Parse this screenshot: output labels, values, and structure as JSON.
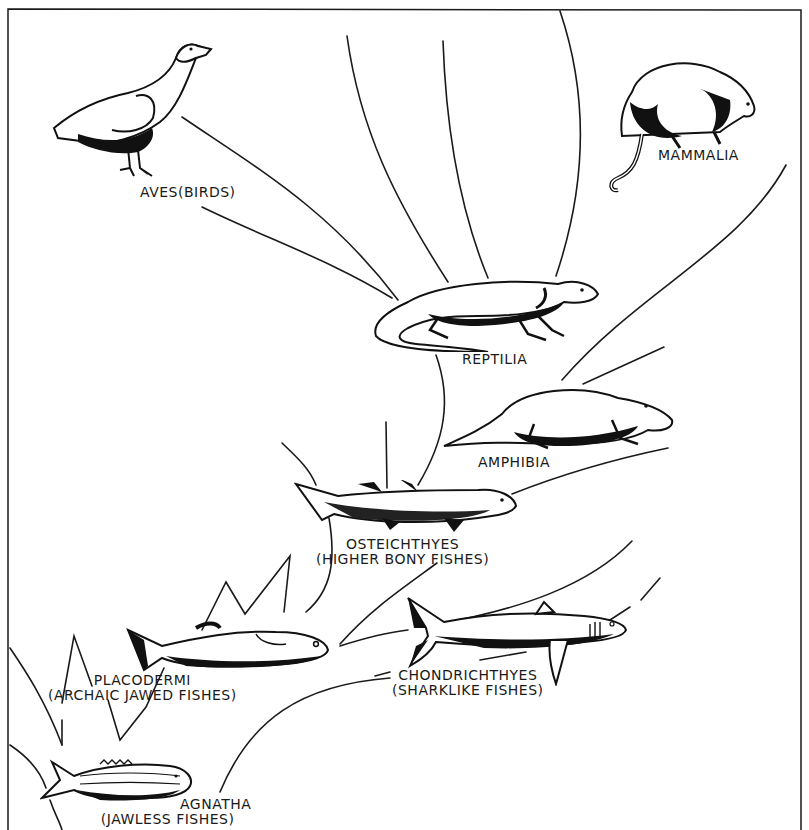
{
  "diagram": {
    "type": "evolutionary-tree",
    "border_color": "#1a1a1a",
    "background": "#ffffff",
    "ink": "#1a1a1a"
  },
  "taxa": {
    "aves": {
      "name": "AVES(BIRDS)",
      "icon": "bird-icon"
    },
    "mammalia": {
      "name": "MAMMALIA",
      "icon": "opossum-icon"
    },
    "reptilia": {
      "name": "REPTILIA",
      "icon": "lizard-icon"
    },
    "amphibia": {
      "name": "AMPHIBIA",
      "icon": "amphibian-icon"
    },
    "osteichthyes": {
      "name": "OSTEICHTHYES",
      "common": "(HIGHER BONY FISHES)",
      "icon": "bony-fish-icon"
    },
    "placodermi": {
      "name": "PLACODERMI",
      "common": "(ARCHAIC JAWED FISHES)",
      "icon": "placoderm-icon"
    },
    "chondrichthyes": {
      "name": "CHONDRICHTHYES",
      "common": "(SHARKLIKE FISHES)",
      "icon": "shark-icon"
    },
    "agnatha": {
      "name": "AGNATHA",
      "common": "(JAWLESS FISHES)",
      "icon": "jawless-fish-icon"
    }
  }
}
